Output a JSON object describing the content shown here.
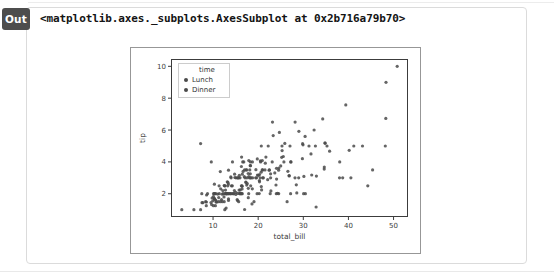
{
  "output_cell": {
    "label": "Out",
    "repr_text": "<matplotlib.axes._subplots.AxesSubplot at 0x2b716a79b70>"
  },
  "colors": {
    "badge_bg": "#4d4d4d",
    "badge_text": "#ffffff",
    "container_border": "#dbdbdb",
    "figure_border": "#979797",
    "spine": "#3c3c3c",
    "tick_label": "#3c3c3c",
    "marker": "#4a4a4a",
    "legend_border": "#cccccc"
  },
  "chart_data": {
    "type": "scatter",
    "title": "",
    "xlabel": "total_bill",
    "ylabel": "tip",
    "xlim": [
      0.68,
      53.2
    ],
    "ylim": [
      0.54,
      10.46
    ],
    "xticks": [
      10,
      20,
      30,
      40,
      50
    ],
    "yticks": [
      2,
      4,
      6,
      8,
      10
    ],
    "grid": false,
    "legend": {
      "title": "time",
      "position": "upper-left",
      "entries": [
        "Lunch",
        "Dinner"
      ]
    },
    "series": [
      {
        "name": "Lunch",
        "points": [
          [
            27.2,
            4.0
          ],
          [
            22.76,
            3.0
          ],
          [
            17.29,
            2.71
          ],
          [
            19.44,
            3.0
          ],
          [
            16.66,
            3.4
          ],
          [
            10.07,
            1.83
          ],
          [
            32.68,
            5.0
          ],
          [
            15.98,
            2.03
          ],
          [
            34.83,
            5.17
          ],
          [
            13.03,
            2.0
          ],
          [
            18.28,
            4.0
          ],
          [
            24.71,
            5.85
          ],
          [
            21.16,
            3.0
          ],
          [
            10.65,
            1.5
          ],
          [
            12.43,
            1.8
          ],
          [
            24.08,
            2.92
          ],
          [
            11.69,
            2.31
          ],
          [
            13.42,
            1.68
          ],
          [
            14.26,
            2.5
          ],
          [
            15.95,
            2.0
          ],
          [
            12.48,
            2.52
          ],
          [
            29.8,
            4.2
          ],
          [
            8.52,
            1.48
          ],
          [
            14.52,
            2.0
          ],
          [
            11.38,
            2.0
          ],
          [
            22.82,
            2.18
          ],
          [
            19.08,
            1.5
          ],
          [
            20.27,
            2.83
          ],
          [
            11.17,
            1.5
          ],
          [
            12.26,
            2.0
          ],
          [
            18.26,
            3.25
          ],
          [
            8.51,
            1.25
          ],
          [
            10.33,
            2.0
          ],
          [
            14.15,
            2.0
          ],
          [
            16.0,
            2.0
          ],
          [
            13.16,
            2.75
          ],
          [
            17.47,
            3.5
          ],
          [
            34.3,
            6.7
          ],
          [
            41.19,
            5.0
          ],
          [
            27.05,
            5.0
          ],
          [
            16.43,
            2.3
          ],
          [
            8.35,
            1.5
          ],
          [
            18.64,
            1.36
          ],
          [
            11.87,
            1.63
          ],
          [
            9.78,
            1.73
          ],
          [
            7.51,
            2.0
          ],
          [
            19.81,
            4.19
          ],
          [
            28.44,
            2.56
          ],
          [
            15.48,
            2.02
          ],
          [
            16.58,
            4.0
          ],
          [
            7.56,
            1.44
          ],
          [
            10.34,
            2.0
          ],
          [
            43.11,
            5.0
          ],
          [
            13.0,
            2.0
          ],
          [
            13.51,
            2.0
          ],
          [
            18.71,
            4.0
          ],
          [
            12.74,
            2.01
          ],
          [
            13.0,
            2.0
          ],
          [
            16.4,
            2.5
          ],
          [
            20.53,
            4.0
          ],
          [
            16.47,
            3.23
          ],
          [
            12.16,
            2.2
          ],
          [
            13.42,
            3.48
          ],
          [
            8.58,
            1.92
          ],
          [
            15.98,
            3.0
          ],
          [
            13.42,
            1.58
          ],
          [
            16.27,
            2.5
          ],
          [
            10.09,
            2.0
          ]
        ]
      },
      {
        "name": "Dinner",
        "points": [
          [
            16.99,
            1.01
          ],
          [
            10.34,
            1.66
          ],
          [
            21.01,
            3.5
          ],
          [
            23.68,
            3.31
          ],
          [
            24.59,
            3.61
          ],
          [
            25.29,
            4.71
          ],
          [
            8.77,
            2.0
          ],
          [
            26.88,
            3.12
          ],
          [
            15.04,
            1.96
          ],
          [
            14.78,
            3.23
          ],
          [
            10.27,
            1.71
          ],
          [
            35.26,
            5.0
          ],
          [
            15.42,
            1.57
          ],
          [
            18.43,
            3.0
          ],
          [
            14.83,
            3.02
          ],
          [
            21.58,
            3.92
          ],
          [
            10.33,
            1.67
          ],
          [
            16.29,
            3.71
          ],
          [
            16.97,
            3.5
          ],
          [
            20.65,
            3.35
          ],
          [
            17.92,
            4.08
          ],
          [
            20.29,
            2.75
          ],
          [
            15.77,
            2.23
          ],
          [
            39.42,
            7.58
          ],
          [
            19.82,
            3.18
          ],
          [
            17.81,
            2.34
          ],
          [
            13.37,
            2.0
          ],
          [
            12.69,
            2.0
          ],
          [
            21.7,
            4.3
          ],
          [
            19.65,
            3.0
          ],
          [
            9.55,
            1.45
          ],
          [
            18.35,
            2.5
          ],
          [
            15.06,
            3.0
          ],
          [
            20.69,
            2.45
          ],
          [
            17.78,
            3.27
          ],
          [
            24.06,
            3.6
          ],
          [
            16.31,
            2.0
          ],
          [
            16.93,
            3.07
          ],
          [
            18.69,
            2.31
          ],
          [
            31.27,
            5.0
          ],
          [
            16.04,
            2.24
          ],
          [
            17.46,
            2.54
          ],
          [
            13.94,
            3.06
          ],
          [
            9.68,
            1.32
          ],
          [
            30.4,
            5.6
          ],
          [
            18.29,
            3.0
          ],
          [
            22.23,
            5.0
          ],
          [
            32.4,
            6.0
          ],
          [
            28.55,
            2.05
          ],
          [
            18.04,
            3.0
          ],
          [
            12.54,
            2.5
          ],
          [
            10.29,
            2.6
          ],
          [
            34.81,
            5.2
          ],
          [
            9.94,
            1.56
          ],
          [
            25.56,
            4.34
          ],
          [
            19.49,
            3.51
          ],
          [
            38.01,
            3.0
          ],
          [
            26.41,
            1.5
          ],
          [
            11.24,
            1.76
          ],
          [
            48.27,
            6.73
          ],
          [
            20.29,
            3.21
          ],
          [
            13.81,
            2.0
          ],
          [
            11.02,
            1.98
          ],
          [
            18.29,
            3.76
          ],
          [
            17.59,
            2.64
          ],
          [
            20.08,
            3.15
          ],
          [
            16.45,
            2.47
          ],
          [
            3.07,
            1.0
          ],
          [
            20.23,
            2.01
          ],
          [
            15.01,
            2.09
          ],
          [
            12.02,
            1.97
          ],
          [
            17.07,
            3.0
          ],
          [
            26.86,
            3.14
          ],
          [
            25.28,
            5.0
          ],
          [
            14.73,
            2.2
          ],
          [
            10.51,
            1.25
          ],
          [
            17.92,
            3.08
          ],
          [
            28.97,
            3.0
          ],
          [
            22.49,
            3.5
          ],
          [
            5.75,
            1.0
          ],
          [
            16.32,
            4.3
          ],
          [
            22.75,
            3.25
          ],
          [
            40.17,
            4.73
          ],
          [
            27.28,
            4.0
          ],
          [
            12.03,
            1.5
          ],
          [
            21.01,
            3.0
          ],
          [
            12.46,
            1.5
          ],
          [
            11.35,
            2.5
          ],
          [
            15.38,
            3.0
          ],
          [
            44.3,
            2.5
          ],
          [
            22.42,
            3.48
          ],
          [
            20.92,
            4.08
          ],
          [
            15.36,
            1.64
          ],
          [
            20.49,
            4.06
          ],
          [
            25.21,
            4.29
          ],
          [
            18.24,
            3.76
          ],
          [
            14.31,
            4.0
          ],
          [
            14.0,
            3.0
          ],
          [
            7.25,
            1.0
          ],
          [
            38.07,
            4.0
          ],
          [
            23.95,
            2.55
          ],
          [
            25.71,
            4.0
          ],
          [
            17.31,
            3.5
          ],
          [
            29.93,
            5.07
          ],
          [
            14.07,
            2.5
          ],
          [
            13.13,
            2.0
          ],
          [
            17.26,
            2.74
          ],
          [
            24.55,
            2.0
          ],
          [
            19.77,
            2.0
          ],
          [
            29.85,
            5.14
          ],
          [
            48.17,
            5.0
          ],
          [
            25.0,
            3.75
          ],
          [
            13.39,
            2.61
          ],
          [
            16.49,
            2.0
          ],
          [
            21.5,
            3.5
          ],
          [
            12.66,
            2.5
          ],
          [
            16.21,
            2.0
          ],
          [
            13.81,
            2.0
          ],
          [
            17.51,
            3.0
          ],
          [
            24.52,
            3.48
          ],
          [
            20.76,
            2.24
          ],
          [
            31.71,
            4.5
          ],
          [
            10.59,
            1.61
          ],
          [
            10.63,
            2.0
          ],
          [
            50.81,
            10.0
          ],
          [
            15.81,
            3.16
          ],
          [
            7.25,
            5.15
          ],
          [
            31.85,
            3.18
          ],
          [
            16.82,
            4.0
          ],
          [
            32.9,
            3.11
          ],
          [
            17.89,
            2.0
          ],
          [
            14.48,
            2.0
          ],
          [
            9.6,
            4.0
          ],
          [
            34.63,
            3.55
          ],
          [
            34.65,
            3.68
          ],
          [
            23.33,
            5.65
          ],
          [
            45.35,
            3.5
          ],
          [
            23.17,
            6.5
          ],
          [
            40.55,
            3.0
          ],
          [
            20.69,
            5.0
          ],
          [
            20.9,
            3.5
          ],
          [
            30.46,
            2.0
          ],
          [
            18.15,
            3.5
          ],
          [
            23.1,
            4.0
          ],
          [
            15.69,
            1.5
          ],
          [
            26.59,
            3.41
          ],
          [
            38.73,
            3.0
          ],
          [
            24.27,
            2.03
          ],
          [
            12.76,
            2.23
          ],
          [
            30.06,
            2.0
          ],
          [
            25.89,
            5.16
          ],
          [
            48.33,
            9.0
          ],
          [
            13.27,
            2.5
          ],
          [
            28.17,
            6.5
          ],
          [
            12.9,
            1.1
          ],
          [
            28.15,
            3.0
          ],
          [
            11.59,
            1.5
          ],
          [
            7.74,
            1.44
          ],
          [
            30.14,
            3.09
          ],
          [
            20.45,
            3.0
          ],
          [
            13.28,
            2.72
          ],
          [
            22.12,
            2.88
          ],
          [
            24.01,
            2.0
          ],
          [
            15.69,
            3.0
          ],
          [
            11.61,
            3.39
          ],
          [
            10.77,
            1.47
          ],
          [
            15.53,
            3.0
          ],
          [
            10.07,
            1.25
          ],
          [
            12.6,
            1.0
          ],
          [
            32.83,
            1.17
          ],
          [
            35.83,
            4.67
          ],
          [
            29.03,
            5.92
          ],
          [
            27.18,
            2.0
          ],
          [
            22.67,
            2.0
          ],
          [
            17.82,
            1.75
          ],
          [
            18.78,
            3.0
          ]
        ]
      }
    ]
  }
}
